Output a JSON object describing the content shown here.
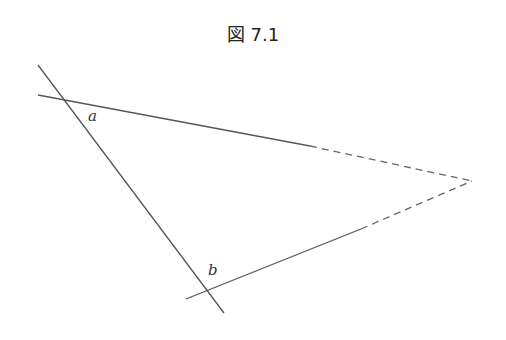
{
  "figure": {
    "title": "図 7.1",
    "labels": {
      "a": "a",
      "b": "b"
    },
    "colors": {
      "line": "#555555"
    }
  }
}
